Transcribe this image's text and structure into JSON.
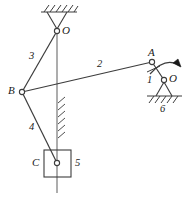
{
  "figure": {
    "type": "mechanism-kinematic-diagram",
    "stroke_color": "#3c3c3c",
    "hatch_color": "#3c3c3c",
    "background": "#ffffff"
  },
  "labels": {
    "pivot_o_top": "O",
    "joint_b": "B",
    "joint_a": "A",
    "joint_c": "C",
    "pivot_o_right": "O",
    "link_1": "1",
    "link_2": "2",
    "link_3": "3",
    "link_4": "4",
    "link_5": "5",
    "link_6": "6"
  },
  "geometry": {
    "pivot_o_top": {
      "x": 57,
      "y": 31
    },
    "joint_b": {
      "x": 22,
      "y": 92
    },
    "joint_a": {
      "x": 152,
      "y": 62
    },
    "joint_c": {
      "x": 57,
      "y": 163
    },
    "pivot_o_right": {
      "x": 164,
      "y": 80
    },
    "slider_block": {
      "x": 44,
      "y": 150,
      "width": 27,
      "height": 27
    },
    "guide_line": {
      "x": 57,
      "y_top": 31,
      "y_bottom": 193
    },
    "ground_top": {
      "x1": 42,
      "x2": 76,
      "y": 12
    },
    "ground_right": {
      "x1": 148,
      "x2": 182,
      "y": 97
    },
    "rotation_arrow": "clockwise"
  },
  "annotations": {
    "rotation_direction": "clockwise-curved-arrow",
    "icons": {
      "ground_hatch": "ground-hatch-icon",
      "pin_joint": "pin-joint-icon",
      "slider": "slider-block-icon",
      "arrow": "curved-arrow-icon"
    }
  }
}
